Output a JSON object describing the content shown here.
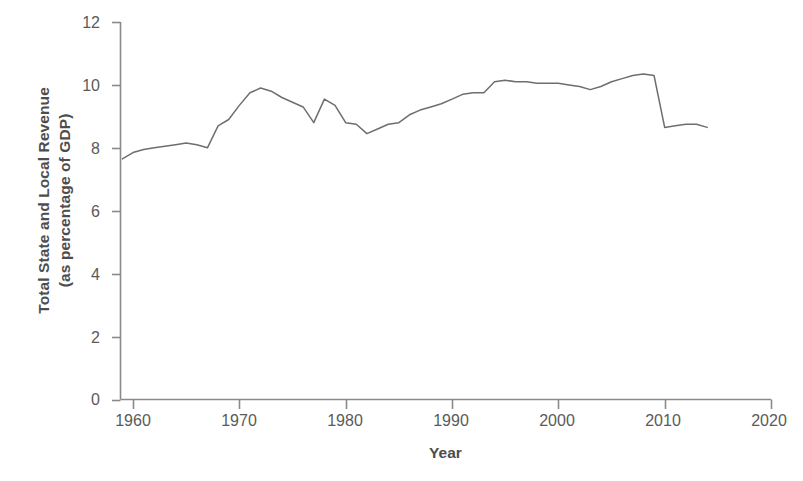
{
  "chart_data": {
    "type": "line",
    "title": "",
    "xlabel": "Year",
    "ylabel": "Total State and Local Revenue (as percentage of GDP)",
    "ylabel_line1": "Total State and Local Revenue",
    "ylabel_line2": "(as percentage of GDP)",
    "xlim": [
      1960,
      2020
    ],
    "ylim": [
      0,
      12
    ],
    "xticks": [
      "1960",
      "1970",
      "1980",
      "1990",
      "2000",
      "2010",
      "2020"
    ],
    "xtick_values": [
      1960,
      1970,
      1980,
      1990,
      2000,
      2010,
      2020
    ],
    "yticks": [
      "0",
      "2",
      "4",
      "6",
      "8",
      "10",
      "12"
    ],
    "ytick_values": [
      0,
      2,
      4,
      6,
      8,
      10,
      12
    ],
    "grid": false,
    "legend": false,
    "legend_position": "none",
    "line_color": "#6e6e6e",
    "series": [
      {
        "name": "Total State and Local Revenue (as percentage of GDP)",
        "x": [
          1959,
          1960,
          1961,
          1962,
          1963,
          1964,
          1965,
          1966,
          1967,
          1968,
          1969,
          1970,
          1971,
          1972,
          1973,
          1974,
          1975,
          1976,
          1977,
          1978,
          1979,
          1980,
          1981,
          1982,
          1983,
          1984,
          1985,
          1986,
          1987,
          1988,
          1989,
          1990,
          1991,
          1992,
          1993,
          1994,
          1995,
          1996,
          1997,
          1998,
          1999,
          2000,
          2001,
          2002,
          2003,
          2004,
          2005,
          2006,
          2007,
          2008,
          2009,
          2010,
          2011,
          2012,
          2013,
          2014
        ],
        "values": [
          7.65,
          7.85,
          7.95,
          8.0,
          8.05,
          8.1,
          8.15,
          8.1,
          8.0,
          8.7,
          8.9,
          9.35,
          9.75,
          9.9,
          9.8,
          9.6,
          9.45,
          9.3,
          8.8,
          9.55,
          9.35,
          8.8,
          8.75,
          8.45,
          8.6,
          8.75,
          8.8,
          9.05,
          9.2,
          9.3,
          9.4,
          9.55,
          9.7,
          9.75,
          9.75,
          10.1,
          10.15,
          10.1,
          10.1,
          10.05,
          10.05,
          10.05,
          10.0,
          9.95,
          9.85,
          9.95,
          10.1,
          10.2,
          10.3,
          10.35,
          10.3,
          8.65,
          8.7,
          8.75,
          8.75,
          8.65
        ]
      }
    ]
  }
}
